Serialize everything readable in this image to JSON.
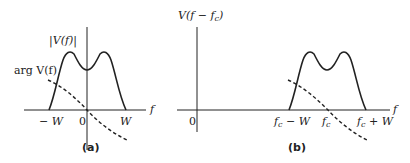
{
  "panels": [
    {
      "id": "a",
      "caption": "(a)",
      "magnitude_label": "|V(f)|",
      "phase_label": "arg V(f)",
      "x_axis_label": "f",
      "ticks": [
        "− W",
        "0",
        "W"
      ],
      "curves": {
        "magnitude": "solid double-humped band from -W to W, symmetric about 0",
        "phase": "dashed decreasing line passing through origin"
      }
    },
    {
      "id": "b",
      "caption": "(b)",
      "y_axis_label": "V(f − fc)",
      "y_axis_label_parts": {
        "prefix": "V(f − f",
        "sub": "c",
        "suffix": ")"
      },
      "x_axis_label": "f",
      "origin_label": "0",
      "ticks": [
        {
          "main": "f",
          "sub": "c",
          "rest": " − W"
        },
        {
          "main": "f",
          "sub": "c",
          "rest": ""
        },
        {
          "main": "f",
          "sub": "c",
          "rest": " + W"
        }
      ],
      "curves": {
        "magnitude": "solid double-humped band from fc-W to fc+W, shifted spectrum",
        "phase": "dashed decreasing line crossing axis at fc"
      }
    }
  ],
  "colors": {
    "stroke": "#222222",
    "background": "#ffffff"
  }
}
